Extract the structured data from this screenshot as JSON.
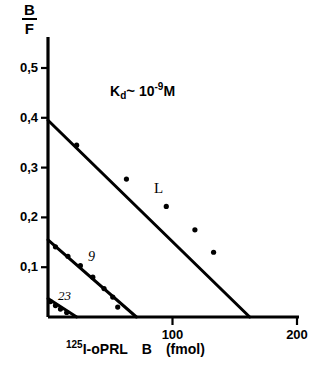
{
  "chart_data": {
    "type": "scatter",
    "title": "",
    "subtitle": "",
    "ylabel_numerator": "B",
    "ylabel_denominator": "F",
    "xlabel_superscript": "125",
    "xlabel_isotope": "I-oPRL",
    "xlabel_variable": "B",
    "xlabel_units": "(fmol)",
    "xlabel_full": "125I-oPRL  B  (fmol)",
    "annotation": {
      "symbol": "K",
      "subscript": "d",
      "approx": "~",
      "base": "10",
      "exponent": "-9",
      "unit": "M",
      "text": "Kd ~ 10-9 M"
    },
    "xlim": [
      0,
      200
    ],
    "ylim": [
      0,
      0.55
    ],
    "grid": false,
    "legend": "inline-labels",
    "xticks": [
      100,
      200
    ],
    "xtick_labels": [
      "100",
      "200"
    ],
    "yticks": [
      0.1,
      0.2,
      0.3,
      0.4,
      0.5
    ],
    "ytick_labels": [
      "0,1",
      "0,2",
      "0,3",
      "0,4",
      "0,5"
    ],
    "series": [
      {
        "name": "L",
        "label": "L",
        "y_intercept": 0.395,
        "x_intercept": 162,
        "points": [
          {
            "x": 23,
            "y": 0.345
          },
          {
            "x": 63,
            "y": 0.277
          },
          {
            "x": 95,
            "y": 0.222
          },
          {
            "x": 118,
            "y": 0.175
          },
          {
            "x": 133,
            "y": 0.13
          }
        ]
      },
      {
        "name": "9",
        "label": "9",
        "y_intercept": 0.155,
        "x_intercept": 71,
        "points": [
          {
            "x": 6,
            "y": 0.141
          },
          {
            "x": 16,
            "y": 0.122
          },
          {
            "x": 26,
            "y": 0.103
          },
          {
            "x": 36,
            "y": 0.08
          },
          {
            "x": 45,
            "y": 0.057
          },
          {
            "x": 52,
            "y": 0.04
          },
          {
            "x": 56,
            "y": 0.02
          }
        ]
      },
      {
        "name": "23",
        "label": "23",
        "y_intercept": 0.037,
        "x_intercept": 23,
        "points": [
          {
            "x": 2,
            "y": 0.031
          },
          {
            "x": 6,
            "y": 0.023
          },
          {
            "x": 10,
            "y": 0.016
          },
          {
            "x": 15,
            "y": 0.009
          }
        ]
      }
    ],
    "colors": {
      "axis": "#000000",
      "line": "#000000",
      "marker": "#000000",
      "background": "#ffffff"
    }
  }
}
